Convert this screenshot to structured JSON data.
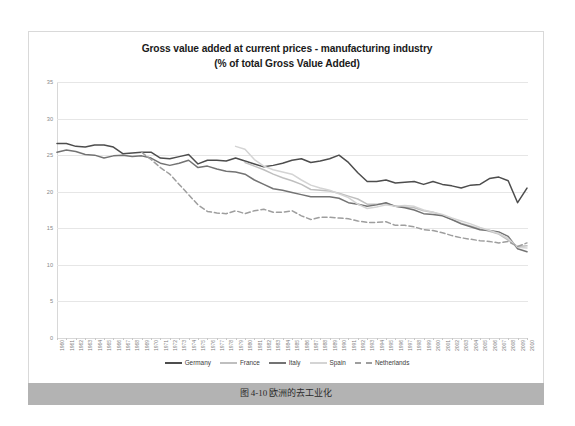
{
  "figure": {
    "caption": "图 4-10 欧洲的去工业化"
  },
  "chart_data": {
    "type": "line",
    "title": "Gross value added at current prices - manufacturing industry",
    "subtitle": "(% of total Gross Value Added)",
    "xlabel": "",
    "ylabel": "",
    "ylim": [
      0,
      35
    ],
    "yticks": [
      0,
      5,
      10,
      15,
      20,
      25,
      30,
      35
    ],
    "grid": true,
    "legend_position": "bottom",
    "x": [
      1960,
      1961,
      1962,
      1963,
      1964,
      1965,
      1966,
      1967,
      1968,
      1969,
      1970,
      1971,
      1972,
      1973,
      1974,
      1975,
      1976,
      1977,
      1978,
      1979,
      1980,
      1981,
      1982,
      1983,
      1984,
      1985,
      1986,
      1987,
      1988,
      1989,
      1990,
      1991,
      1992,
      1993,
      1994,
      1995,
      1996,
      1997,
      1998,
      1999,
      2000,
      2001,
      2002,
      2003,
      2004,
      2005,
      2006,
      2007,
      2008,
      2009,
      2010
    ],
    "categories": [
      "1960",
      "1961",
      "1962",
      "1963",
      "1964",
      "1965",
      "1966",
      "1967",
      "1968",
      "1969",
      "1970",
      "1971",
      "1972",
      "1973",
      "1974",
      "1975",
      "1976",
      "1977",
      "1978",
      "1979",
      "1980",
      "1981",
      "1982",
      "1983",
      "1984",
      "1985",
      "1986",
      "1987",
      "1988",
      "1989",
      "1990",
      "1991",
      "1992",
      "1993",
      "1994",
      "1995",
      "1996",
      "1997",
      "1998",
      "1999",
      "2000",
      "2001",
      "2002",
      "2003",
      "2004",
      "2005",
      "2006",
      "2007",
      "2008",
      "2009",
      "2010"
    ],
    "series": [
      {
        "name": "Germany",
        "color": "#4d4d4d",
        "dash": "solid",
        "values": [
          26.6,
          26.6,
          26.2,
          26.1,
          26.4,
          26.4,
          26.1,
          25.2,
          25.3,
          25.4,
          25.4,
          24.6,
          24.5,
          24.8,
          25.1,
          23.8,
          24.3,
          24.3,
          24.2,
          24.6,
          24.2,
          23.8,
          23.4,
          23.6,
          23.9,
          24.3,
          24.5,
          24.0,
          24.2,
          24.5,
          25.0,
          24.0,
          22.6,
          21.4,
          21.4,
          21.6,
          21.2,
          21.3,
          21.4,
          21.0,
          21.4,
          21.0,
          20.8,
          20.5,
          20.9,
          21.0,
          21.8,
          22.0,
          21.5,
          18.5,
          20.5
        ]
      },
      {
        "name": "France",
        "color": "#bfbfbf",
        "dash": "solid",
        "values": [
          null,
          null,
          null,
          null,
          null,
          null,
          null,
          null,
          null,
          null,
          null,
          null,
          null,
          null,
          null,
          null,
          null,
          null,
          null,
          null,
          24.0,
          23.5,
          23.0,
          22.4,
          21.9,
          21.5,
          21.0,
          20.3,
          20.2,
          20.1,
          19.8,
          19.4,
          19.0,
          18.3,
          18.3,
          18.4,
          18.0,
          17.9,
          17.8,
          17.4,
          17.2,
          16.8,
          16.2,
          15.7,
          15.3,
          14.9,
          14.6,
          14.2,
          13.4,
          12.5,
          12.6
        ]
      },
      {
        "name": "Italy",
        "color": "#737373",
        "dash": "solid",
        "values": [
          25.4,
          25.7,
          25.5,
          25.1,
          25.0,
          24.6,
          24.9,
          25.0,
          24.8,
          24.9,
          24.6,
          23.9,
          23.6,
          23.9,
          24.3,
          23.3,
          23.5,
          23.1,
          22.8,
          22.7,
          22.4,
          21.6,
          21.0,
          20.4,
          20.2,
          19.9,
          19.6,
          19.3,
          19.3,
          19.3,
          19.1,
          18.5,
          18.3,
          18.0,
          18.2,
          18.5,
          18.0,
          17.8,
          17.5,
          17.0,
          16.9,
          16.7,
          16.2,
          15.6,
          15.2,
          14.8,
          14.7,
          14.5,
          13.9,
          12.2,
          11.8
        ]
      },
      {
        "name": "Spain",
        "color": "#d4d4d4",
        "dash": "solid",
        "values": [
          null,
          null,
          null,
          null,
          null,
          null,
          null,
          null,
          null,
          null,
          null,
          null,
          null,
          null,
          null,
          null,
          null,
          null,
          null,
          26.2,
          25.8,
          24.4,
          23.5,
          23.0,
          22.7,
          22.4,
          21.6,
          20.9,
          20.5,
          20.2,
          19.7,
          19.2,
          18.3,
          17.7,
          17.9,
          18.2,
          18.0,
          18.1,
          18.0,
          17.5,
          17.2,
          16.9,
          16.4,
          16.0,
          15.6,
          15.1,
          14.7,
          14.3,
          13.6,
          12.4,
          12.3
        ]
      },
      {
        "name": "Netherlands",
        "color": "#9e9e9e",
        "dash": "dashed",
        "values": [
          null,
          null,
          null,
          null,
          null,
          null,
          null,
          null,
          null,
          25.4,
          24.4,
          23.3,
          22.4,
          21.0,
          19.6,
          18.2,
          17.3,
          17.1,
          17.0,
          17.4,
          17.0,
          17.4,
          17.6,
          17.2,
          17.2,
          17.4,
          16.7,
          16.2,
          16.5,
          16.5,
          16.4,
          16.3,
          16.0,
          15.8,
          15.8,
          15.9,
          15.4,
          15.4,
          15.2,
          14.8,
          14.7,
          14.4,
          14.0,
          13.7,
          13.5,
          13.3,
          13.2,
          13.0,
          13.2,
          12.5,
          13.0
        ]
      }
    ],
    "legend": [
      {
        "label": "Germany",
        "color": "#4d4d4d",
        "dash": "solid"
      },
      {
        "label": "France",
        "color": "#bfbfbf",
        "dash": "solid"
      },
      {
        "label": "Italy",
        "color": "#737373",
        "dash": "solid"
      },
      {
        "label": "Spain",
        "color": "#d4d4d4",
        "dash": "solid"
      },
      {
        "label": "Netherlands",
        "color": "#9e9e9e",
        "dash": "dashed"
      }
    ]
  }
}
